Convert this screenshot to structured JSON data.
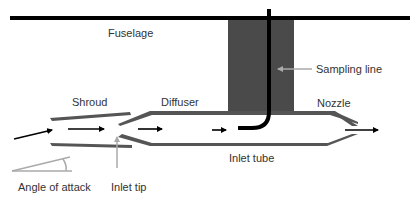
{
  "diagram": {
    "type": "schematic",
    "labels": {
      "fuselage": "Fuselage",
      "sampling_line": "Sampling line",
      "shroud": "Shroud",
      "diffuser": "Diffuser",
      "nozzle": "Nozzle",
      "inlet_tube": "Inlet tube",
      "angle_of_attack": "Angle of attack",
      "inlet_tip": "Inlet tip"
    },
    "colors": {
      "fuselage_line": "#000000",
      "strut": "#4a4a4a",
      "walls": "#555555",
      "sampling_line": "#000000",
      "pointer": "#aaaaaa",
      "text": "#333333"
    },
    "flow_arrows": 5
  }
}
